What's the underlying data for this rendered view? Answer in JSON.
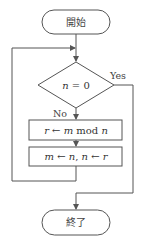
{
  "flowchart": {
    "start": {
      "label": "開始"
    },
    "decision": {
      "label": "n = 0",
      "var": "n",
      "op": " = 0"
    },
    "yes_label": "Yes",
    "no_label": "No",
    "process1": {
      "label": "r ← m mod n",
      "parts": [
        "r",
        " ← ",
        "m",
        " mod ",
        "n"
      ]
    },
    "process2": {
      "label": "m ← n, n ← r",
      "parts": [
        "m",
        " ← ",
        "n",
        ", ",
        "n",
        " ← ",
        "r"
      ]
    },
    "end": {
      "label": "終了"
    },
    "colors": {
      "stroke": "#555555",
      "text": "#333333",
      "background": "#ffffff"
    }
  }
}
